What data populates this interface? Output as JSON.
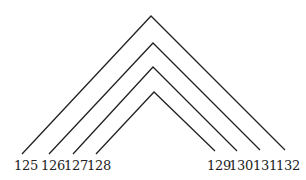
{
  "diagram": {
    "type": "nested-arcs",
    "stroke_color": "#222222",
    "background": "#ffffff",
    "arcs": [
      {
        "left_label": "125",
        "right_label": "132",
        "apex": [
          151,
          16
        ],
        "left_end": [
          22,
          154
        ],
        "right_end": [
          285,
          150
        ]
      },
      {
        "left_label": "126",
        "right_label": "131",
        "apex": [
          153,
          43
        ],
        "left_end": [
          49,
          154
        ],
        "right_end": [
          260,
          150
        ]
      },
      {
        "left_label": "127",
        "right_label": "130",
        "apex": [
          153,
          67
        ],
        "left_end": [
          73,
          154
        ],
        "right_end": [
          237,
          151
        ]
      },
      {
        "left_label": "128",
        "right_label": "129",
        "apex": [
          154,
          92
        ],
        "left_end": [
          96,
          154
        ],
        "right_end": [
          215,
          151
        ]
      }
    ],
    "labels": [
      "125",
      "126",
      "127",
      "128",
      "129",
      "130",
      "131",
      "132"
    ]
  }
}
